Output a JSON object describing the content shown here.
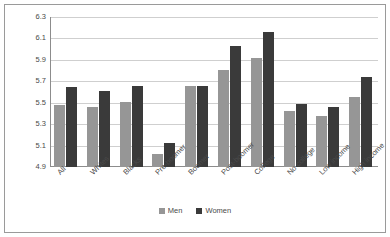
{
  "chart_data": {
    "type": "bar",
    "title": "",
    "xlabel": "",
    "ylabel": "Attitude on gender roles",
    "ylim": [
      4.9,
      6.3
    ],
    "yticks": [
      "4.9",
      "5.1",
      "5.3",
      "5.5",
      "5.7",
      "5.9",
      "6.1",
      "6.3"
    ],
    "grid": true,
    "legend_position": "bottom",
    "categories": [
      "All",
      "Whites",
      "Blacks",
      "Pre-boomer",
      "Boomer",
      "Post-boomer",
      "College",
      "No college",
      "Low income",
      "High income"
    ],
    "series": [
      {
        "name": "Men",
        "color": "#969696",
        "values": [
          5.48,
          5.46,
          5.51,
          5.02,
          5.66,
          5.81,
          5.92,
          5.42,
          5.38,
          5.55
        ]
      },
      {
        "name": "Women",
        "color": "#3a3a3a",
        "values": [
          5.65,
          5.61,
          5.66,
          5.12,
          5.66,
          6.03,
          6.16,
          5.49,
          5.46,
          5.74
        ]
      }
    ]
  }
}
